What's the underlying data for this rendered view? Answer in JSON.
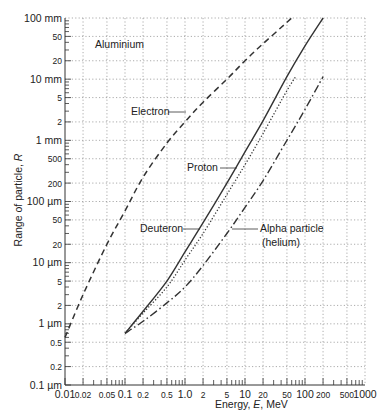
{
  "chart_data": {
    "type": "line",
    "title": "",
    "annotation_material": "Aluminium",
    "xlabel": "Energy, E, MeV",
    "ylabel": "Range of particle, R",
    "xscale": "log",
    "yscale": "log",
    "xlim": [
      0.01,
      1000
    ],
    "ylim_um": [
      0.1,
      100000
    ],
    "grid": true,
    "x_ticks": [
      {
        "value": 0.01,
        "label": "0.01"
      },
      {
        "value": 0.02,
        "label": "0.02"
      },
      {
        "value": 0.05,
        "label": "0.05"
      },
      {
        "value": 0.1,
        "label": "0.1"
      },
      {
        "value": 0.2,
        "label": "0.2"
      },
      {
        "value": 0.5,
        "label": "0.5"
      },
      {
        "value": 1,
        "label": "1.0"
      },
      {
        "value": 2,
        "label": "2"
      },
      {
        "value": 5,
        "label": "5"
      },
      {
        "value": 10,
        "label": "10"
      },
      {
        "value": 20,
        "label": "20"
      },
      {
        "value": 50,
        "label": "50"
      },
      {
        "value": 100,
        "label": "100"
      },
      {
        "value": 200,
        "label": "200"
      },
      {
        "value": 500,
        "label": "500"
      },
      {
        "value": 1000,
        "label": "1000"
      }
    ],
    "y_ticks": [
      {
        "value_um": 100000,
        "label": "100 mm"
      },
      {
        "value_um": 50000,
        "label": "50"
      },
      {
        "value_um": 20000,
        "label": "20"
      },
      {
        "value_um": 10000,
        "label": "10 mm"
      },
      {
        "value_um": 5000,
        "label": "5"
      },
      {
        "value_um": 2000,
        "label": "2"
      },
      {
        "value_um": 1000,
        "label": "1 mm"
      },
      {
        "value_um": 500,
        "label": "500"
      },
      {
        "value_um": 200,
        "label": "200"
      },
      {
        "value_um": 100,
        "label": "100 µm"
      },
      {
        "value_um": 50,
        "label": "50"
      },
      {
        "value_um": 20,
        "label": "20"
      },
      {
        "value_um": 10,
        "label": "10 µm"
      },
      {
        "value_um": 5,
        "label": "5"
      },
      {
        "value_um": 2,
        "label": "2"
      },
      {
        "value_um": 1,
        "label": "1 µm"
      },
      {
        "value_um": 0.5,
        "label": "0.5"
      },
      {
        "value_um": 0.2,
        "label": "0.2"
      },
      {
        "value_um": 0.1,
        "label": "0.1 µm"
      }
    ],
    "series": [
      {
        "name": "Electron",
        "style": "dashed",
        "points": [
          {
            "E": 0.01,
            "R_um": 0.6
          },
          {
            "E": 0.02,
            "R_um": 3
          },
          {
            "E": 0.05,
            "R_um": 20
          },
          {
            "E": 0.1,
            "R_um": 70
          },
          {
            "E": 0.2,
            "R_um": 250
          },
          {
            "E": 0.5,
            "R_um": 900
          },
          {
            "E": 1,
            "R_um": 2000
          },
          {
            "E": 2,
            "R_um": 4200
          },
          {
            "E": 5,
            "R_um": 10000
          },
          {
            "E": 10,
            "R_um": 20000
          },
          {
            "E": 20,
            "R_um": 38000
          },
          {
            "E": 40,
            "R_um": 70000
          },
          {
            "E": 60,
            "R_um": 100000
          }
        ]
      },
      {
        "name": "Proton",
        "style": "solid",
        "points": [
          {
            "E": 0.1,
            "R_um": 0.7
          },
          {
            "E": 0.2,
            "R_um": 1.6
          },
          {
            "E": 0.5,
            "R_um": 5
          },
          {
            "E": 1,
            "R_um": 15
          },
          {
            "E": 2,
            "R_um": 45
          },
          {
            "E": 5,
            "R_um": 200
          },
          {
            "E": 10,
            "R_um": 650
          },
          {
            "E": 20,
            "R_um": 2100
          },
          {
            "E": 50,
            "R_um": 11000
          },
          {
            "E": 100,
            "R_um": 35000
          },
          {
            "E": 200,
            "R_um": 100000
          }
        ]
      },
      {
        "name": "Deuteron",
        "style": "dotted",
        "points": [
          {
            "E": 0.1,
            "R_um": 0.7
          },
          {
            "E": 0.2,
            "R_um": 1.5
          },
          {
            "E": 0.5,
            "R_um": 4
          },
          {
            "E": 1,
            "R_um": 11
          },
          {
            "E": 2,
            "R_um": 30
          },
          {
            "E": 5,
            "R_um": 130
          },
          {
            "E": 10,
            "R_um": 400
          },
          {
            "E": 20,
            "R_um": 1300
          },
          {
            "E": 50,
            "R_um": 6500
          },
          {
            "E": 70,
            "R_um": 11000
          }
        ]
      },
      {
        "name": "Alpha particle (helium)",
        "style": "dash-dot",
        "points": [
          {
            "E": 0.1,
            "R_um": 0.7
          },
          {
            "E": 0.2,
            "R_um": 1.1
          },
          {
            "E": 0.5,
            "R_um": 2.2
          },
          {
            "E": 1,
            "R_um": 4
          },
          {
            "E": 2,
            "R_um": 9
          },
          {
            "E": 5,
            "R_um": 30
          },
          {
            "E": 10,
            "R_um": 80
          },
          {
            "E": 20,
            "R_um": 220
          },
          {
            "E": 50,
            "R_um": 1000
          },
          {
            "E": 100,
            "R_um": 3200
          },
          {
            "E": 200,
            "R_um": 11000
          }
        ]
      }
    ],
    "labels": [
      {
        "text": "Aluminium",
        "series": null
      },
      {
        "text": "Electron",
        "series": "Electron"
      },
      {
        "text": "Proton",
        "series": "Proton"
      },
      {
        "text": "Deuteron",
        "series": "Deuteron"
      },
      {
        "text": "Alpha particle",
        "series": "Alpha particle (helium)"
      },
      {
        "text": "(helium)",
        "series": "Alpha particle (helium)"
      }
    ],
    "legend": "inline labels with leader lines"
  },
  "text": {
    "material": "Aluminium",
    "xlabel_pre": "Energy, ",
    "xlabel_var": "E",
    "xlabel_post": ", MeV",
    "ylabel_pre": "Range of particle, ",
    "ylabel_var": "R",
    "electron": "Electron",
    "proton": "Proton",
    "deuteron": "Deuteron",
    "alpha1": "Alpha particle",
    "alpha2": "(helium)"
  }
}
